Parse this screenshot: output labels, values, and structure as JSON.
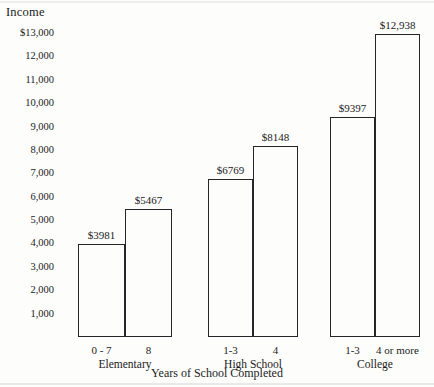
{
  "chart_data": {
    "type": "bar",
    "title": "",
    "ylabel": "Income",
    "xlabel": "Years of School Completed",
    "ylim": [
      0,
      13000
    ],
    "ytick_values": [
      13000,
      12000,
      11000,
      10000,
      9000,
      8000,
      7000,
      6000,
      5000,
      4000,
      3000,
      2000,
      1000
    ],
    "ytick_labels": [
      "$13,000",
      "12,000",
      "11,000",
      "10,000",
      "9,000",
      "8,000",
      "7,000",
      "6,000",
      "5,000",
      "4,000",
      "3,000",
      "2,000",
      "1,000"
    ],
    "grid": false,
    "legend": "none",
    "groups": [
      {
        "name": "Elementary",
        "bars": [
          {
            "category": "0 - 7",
            "value": 3981,
            "label": "$3981"
          },
          {
            "category": "8",
            "value": 5467,
            "label": "$5467"
          }
        ]
      },
      {
        "name": "High School",
        "bars": [
          {
            "category": "1-3",
            "value": 6769,
            "label": "$6769"
          },
          {
            "category": "4",
            "value": 8148,
            "label": "$8148"
          }
        ]
      },
      {
        "name": "College",
        "bars": [
          {
            "category": "1-3",
            "value": 9397,
            "label": "$9397"
          },
          {
            "category": "4 or more",
            "value": 12938,
            "label": "$12,938"
          }
        ]
      }
    ],
    "categories": [
      "0 - 7",
      "8",
      "1-3",
      "4",
      "1-3",
      "4 or more"
    ],
    "values": [
      3981,
      5467,
      6769,
      8148,
      9397,
      12938
    ],
    "value_labels": [
      "$3981",
      "$5467",
      "$6769",
      "$8148",
      "$9397",
      "$12,938"
    ],
    "colors": {
      "bar_outline": "#26262a",
      "bar_fill": "transparent",
      "text": "#1b1b1b",
      "background": "#fdfdfc"
    }
  }
}
